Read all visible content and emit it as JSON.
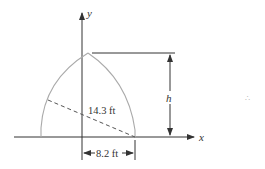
{
  "diagram": {
    "axes": {
      "x_label": "x",
      "y_label": "y"
    },
    "dimensions": {
      "height_label": "h",
      "diagonal_label": "14.3 ft",
      "base_label": "8.2 ft"
    },
    "colors": {
      "curve": "#aaaaaa",
      "lines": "#333333",
      "background": "#ffffff"
    },
    "margin_mark": "∴"
  }
}
